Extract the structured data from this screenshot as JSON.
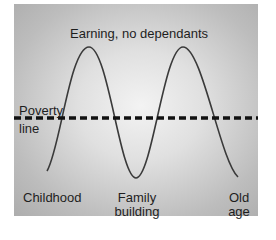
{
  "diagram": {
    "title_label": "Earning, no dependants",
    "poverty_line": {
      "line1": "Poverty",
      "line2": "line"
    },
    "stages": [
      {
        "line1": "Childhood",
        "line2": ""
      },
      {
        "line1": "Family",
        "line2": "building"
      },
      {
        "line1": "Old",
        "line2": "age"
      }
    ],
    "colors": {
      "curve": "#3a3a3a",
      "poverty_line": "#111111",
      "text": "#1e1e1e",
      "panel_light": "#f3f3f3",
      "panel_dark": "#adadad"
    }
  }
}
